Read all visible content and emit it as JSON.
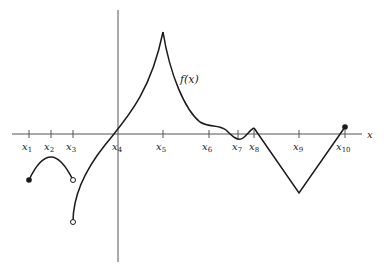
{
  "figure": {
    "function_label": "f(x)",
    "x_axis_label": "x",
    "ticks": [
      {
        "name": "x",
        "sub": "1",
        "px": 29
      },
      {
        "name": "x",
        "sub": "2",
        "px": 51
      },
      {
        "name": "x",
        "sub": "3",
        "px": 73
      },
      {
        "name": "x",
        "sub": "4",
        "px": 118
      },
      {
        "name": "x",
        "sub": "5",
        "px": 163
      },
      {
        "name": "x",
        "sub": "6",
        "px": 209
      },
      {
        "name": "x",
        "sub": "7",
        "px": 238
      },
      {
        "name": "x",
        "sub": "8",
        "px": 254
      },
      {
        "name": "x",
        "sub": "9",
        "px": 299
      },
      {
        "name": "x",
        "sub": "10",
        "px": 345
      }
    ],
    "points": {
      "closed": [
        {
          "at": "x1",
          "x": 29,
          "y": 180
        },
        {
          "at": "x10",
          "x": 345,
          "y": 127
        }
      ],
      "open": [
        {
          "at": "x3",
          "x": 73,
          "y": 180
        },
        {
          "at": "x3",
          "x": 73,
          "y": 222
        }
      ]
    },
    "colors": {
      "curve": "#1a1a1a",
      "axis": "#555555"
    }
  }
}
